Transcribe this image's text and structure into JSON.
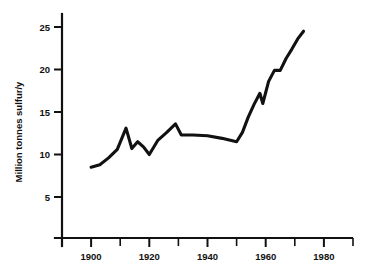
{
  "chart_data": {
    "type": "line",
    "title": "",
    "subtitle": "",
    "xlabel": "",
    "ylabel": "Million tonnes sulfur/y",
    "xlim": [
      1890,
      1992
    ],
    "ylim": [
      0,
      26.5
    ],
    "grid": false,
    "legend": null,
    "x_ticks_major": [
      1900,
      1920,
      1940,
      1960,
      1980
    ],
    "x_ticks_major_labels": [
      "1900",
      "1920",
      "1940",
      "1960",
      "1980"
    ],
    "x_ticks_minor": [
      1890,
      1910,
      1930,
      1950,
      1970,
      1990
    ],
    "y_ticks_major": [
      5,
      10,
      15,
      20,
      25
    ],
    "y_ticks_major_labels": [
      "5",
      "10",
      "15",
      "20",
      "25"
    ],
    "series": [
      {
        "name": "Global sulfur emissions",
        "x": [
          1900,
          1903,
          1906,
          1909,
          1912,
          1914,
          1916,
          1918,
          1920,
          1923,
          1926,
          1929,
          1931,
          1935,
          1940,
          1945,
          1950,
          1952,
          1954,
          1956,
          1958,
          1959,
          1961,
          1963,
          1965,
          1967,
          1969,
          1971,
          1973
        ],
        "y": [
          8.5,
          8.8,
          9.6,
          10.6,
          13.1,
          10.7,
          11.5,
          10.9,
          10.0,
          11.7,
          12.6,
          13.6,
          12.3,
          12.3,
          12.2,
          11.9,
          11.5,
          12.6,
          14.4,
          15.9,
          17.2,
          16.0,
          18.6,
          19.9,
          19.9,
          21.3,
          22.4,
          23.6,
          24.5
        ]
      }
    ]
  },
  "axis": {
    "y_label_text": "Million tonnes sulfur/y"
  }
}
